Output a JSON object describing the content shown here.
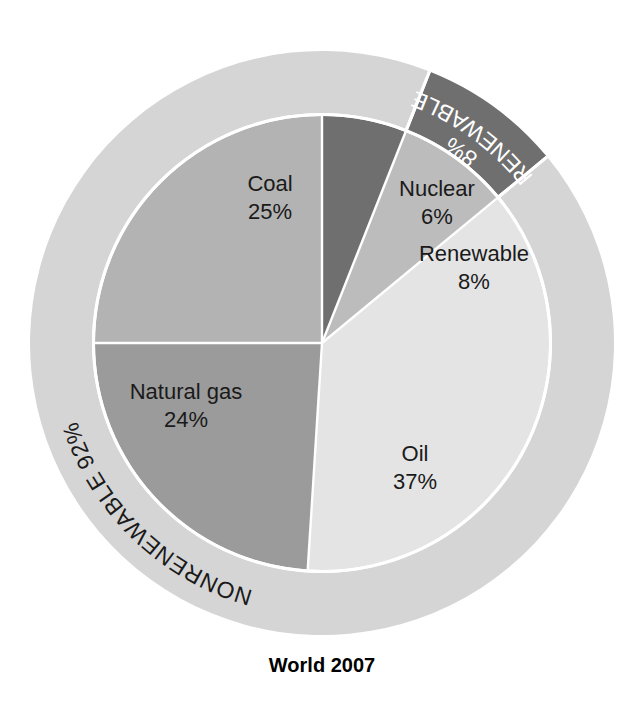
{
  "chart_data": {
    "type": "pie",
    "title": "World 2007",
    "subtitle": "",
    "xlabel": "",
    "ylabel": "",
    "unit": "%",
    "legend_position": "none",
    "grid": false,
    "slices": [
      {
        "label": "Nuclear",
        "value": 6,
        "value_label": "6%",
        "color": "#6f6f6f",
        "text_color": "#1a1a1a",
        "start_angle": 0,
        "end_angle": 21.6
      },
      {
        "label": "Renewable",
        "value": 8,
        "value_label": "8%",
        "color": "#bcbcbc",
        "text_color": "#1a1a1a",
        "start_angle": 21.6,
        "end_angle": 50.4
      },
      {
        "label": "Oil",
        "value": 37,
        "value_label": "37%",
        "color": "#e4e4e4",
        "text_color": "#1a1a1a",
        "start_angle": 50.4,
        "end_angle": 183.6
      },
      {
        "label": "Natural gas",
        "value": 24,
        "value_label": "24%",
        "color": "#9b9b9b",
        "text_color": "#1a1a1a",
        "start_angle": 183.6,
        "end_angle": 270.0
      },
      {
        "label": "Coal",
        "value": 25,
        "value_label": "25%",
        "color": "#b3b3b3",
        "text_color": "#1a1a1a",
        "start_angle": 270.0,
        "end_angle": 360.0
      }
    ],
    "ring_segments": [
      {
        "label": "RENEWABLE",
        "value": 8,
        "value_label": "8%",
        "color": "#6f6f6f",
        "text_color": "#ffffff",
        "start_angle": 21.6,
        "end_angle": 50.4
      },
      {
        "label": "NONRENEWABLE",
        "value": 92,
        "value_label": "92%",
        "color": "#d5d5d5",
        "text_color": "#1a1a1a",
        "start_angle": 50.4,
        "end_angle": 381.6
      }
    ],
    "geometry": {
      "cx": 322,
      "cy": 343,
      "inner_radius": 227,
      "outer_radius": 292,
      "title_x": 322,
      "title_y": 672
    },
    "labels": {
      "coal": {
        "name": "Coal",
        "pct": "25%",
        "x": 270,
        "y": 185
      },
      "nuclear": {
        "name": "Nuclear",
        "pct": "6%",
        "x": 437,
        "y": 190
      },
      "renewable_inner": {
        "name": "Renewable",
        "pct": "8%",
        "x": 474,
        "y": 255
      },
      "oil": {
        "name": "Oil",
        "pct": "37%",
        "x": 415,
        "y": 455
      },
      "natural_gas": {
        "name": "Natural gas",
        "pct": "24%",
        "x": 186,
        "y": 393
      }
    },
    "background_color": "#ffffff",
    "separator_color": "#ffffff"
  }
}
